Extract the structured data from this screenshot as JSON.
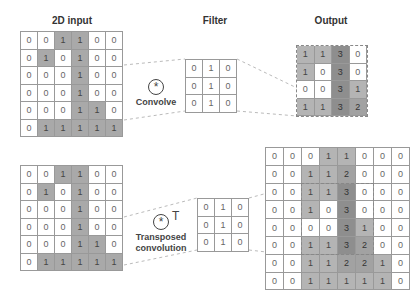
{
  "labels": {
    "input_title": "2D input",
    "filter_title": "Filter",
    "output_title": "Output",
    "convolve_label": "Convolve",
    "transposed_label_line1": "Transposed",
    "transposed_label_line2": "convolution",
    "convolve_symbol": "*",
    "transpose_symbol": "T"
  },
  "top": {
    "input": [
      [
        0,
        0,
        1,
        1,
        0,
        0
      ],
      [
        0,
        1,
        0,
        1,
        0,
        0
      ],
      [
        0,
        0,
        0,
        1,
        0,
        0
      ],
      [
        0,
        0,
        0,
        1,
        0,
        0
      ],
      [
        0,
        0,
        0,
        1,
        1,
        0
      ],
      [
        0,
        1,
        1,
        1,
        1,
        1
      ]
    ],
    "filter": [
      [
        0,
        1,
        0
      ],
      [
        0,
        1,
        0
      ],
      [
        0,
        1,
        0
      ]
    ],
    "output": [
      [
        1,
        1,
        3,
        0
      ],
      [
        1,
        0,
        3,
        0
      ],
      [
        0,
        0,
        3,
        1
      ],
      [
        1,
        1,
        3,
        2
      ]
    ]
  },
  "bottom": {
    "input": [
      [
        0,
        0,
        1,
        1,
        0,
        0
      ],
      [
        0,
        1,
        0,
        1,
        0,
        0
      ],
      [
        0,
        0,
        0,
        1,
        0,
        0
      ],
      [
        0,
        0,
        0,
        1,
        0,
        0
      ],
      [
        0,
        0,
        0,
        1,
        1,
        0
      ],
      [
        0,
        1,
        1,
        1,
        1,
        1
      ]
    ],
    "filter": [
      [
        0,
        1,
        0
      ],
      [
        0,
        1,
        0
      ],
      [
        0,
        1,
        0
      ]
    ],
    "output": [
      [
        0,
        0,
        0,
        1,
        1,
        0,
        0,
        0
      ],
      [
        0,
        0,
        1,
        1,
        2,
        0,
        0,
        0
      ],
      [
        0,
        0,
        1,
        1,
        3,
        0,
        0,
        0
      ],
      [
        0,
        0,
        1,
        0,
        3,
        0,
        0,
        0
      ],
      [
        0,
        0,
        0,
        0,
        3,
        1,
        0,
        0
      ],
      [
        0,
        0,
        1,
        1,
        3,
        2,
        0,
        0
      ],
      [
        0,
        0,
        1,
        1,
        2,
        2,
        1,
        0
      ],
      [
        0,
        0,
        1,
        1,
        1,
        1,
        1,
        0
      ]
    ]
  },
  "colors": {
    "cell_on": "#a9a9a9",
    "value_1": "#b4b4b4",
    "value_2": "#a2a2a2",
    "value_3": "#8e8e8e",
    "grid_line": "#999999"
  }
}
